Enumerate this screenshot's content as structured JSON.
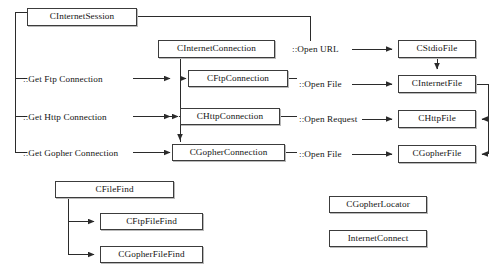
{
  "diagram": {
    "type": "class-relationship-diagram",
    "colors": {
      "background": "#ffffff",
      "box_border": "#3c3c3c",
      "box_fill": "#ffffff",
      "box_shadow": "#b9b9b9",
      "line": "#2b2b2b",
      "text": "#141414"
    },
    "nodes": [
      {
        "id": "cinternetsession",
        "label": "CInternetSession",
        "x": 27,
        "y": 8,
        "w": 110,
        "h": 18
      },
      {
        "id": "cinternetconnection",
        "label": "CInternetConnection",
        "x": 158,
        "y": 40,
        "w": 117,
        "h": 18
      },
      {
        "id": "cftpconnection",
        "label": "CFtpConnection",
        "x": 188,
        "y": 70,
        "w": 100,
        "h": 17
      },
      {
        "id": "chttpconnection",
        "label": "CHttpConnection",
        "x": 180,
        "y": 108,
        "w": 100,
        "h": 17
      },
      {
        "id": "cgopherconnection",
        "label": "CGopherConnection",
        "x": 172,
        "y": 144,
        "w": 113,
        "h": 17
      },
      {
        "id": "cstdiofile",
        "label": "CStdioFile",
        "x": 398,
        "y": 40,
        "w": 78,
        "h": 18
      },
      {
        "id": "cinternetfile",
        "label": "CInternetFile",
        "x": 398,
        "y": 75,
        "w": 78,
        "h": 18
      },
      {
        "id": "chttpfile",
        "label": "CHttpFile",
        "x": 398,
        "y": 110,
        "w": 78,
        "h": 18
      },
      {
        "id": "cgopherfile",
        "label": "CGopherFile",
        "x": 398,
        "y": 145,
        "w": 78,
        "h": 18
      },
      {
        "id": "cfilefind",
        "label": "CFileFind",
        "x": 55,
        "y": 181,
        "w": 119,
        "h": 17
      },
      {
        "id": "cftpfilefind",
        "label": "CFtpFileFind",
        "x": 100,
        "y": 213,
        "w": 103,
        "h": 17
      },
      {
        "id": "cgopherfilefind",
        "label": "CGopherFileFind",
        "x": 100,
        "y": 246,
        "w": 103,
        "h": 17
      },
      {
        "id": "cgopherlocator",
        "label": "CGopherLocator",
        "x": 329,
        "y": 196,
        "w": 98,
        "h": 17
      },
      {
        "id": "internetconnect",
        "label": "InternetConnect",
        "x": 329,
        "y": 230,
        "w": 98,
        "h": 17
      }
    ],
    "labels": [
      {
        "id": "get-ftp-connection",
        "text": "::Get Ftp Connection",
        "x": 23,
        "y": 75
      },
      {
        "id": "get-http-connection",
        "text": "::Get Http Connection",
        "x": 23,
        "y": 113
      },
      {
        "id": "get-gopher-connection",
        "text": "::Get Gopher Connection",
        "x": 23,
        "y": 149
      },
      {
        "id": "open-url",
        "text": "::Open URL",
        "x": 292,
        "y": 46
      },
      {
        "id": "open-file-ftp",
        "text": "::Open File",
        "x": 298,
        "y": 76
      },
      {
        "id": "open-request",
        "text": "::Open Request",
        "x": 298,
        "y": 113
      },
      {
        "id": "open-file-gopher",
        "text": "::Open File",
        "x": 298,
        "y": 149
      }
    ],
    "connections": [
      {
        "from": "CInternetSession",
        "to": "::Get Ftp Connection",
        "kind": "bracket"
      },
      {
        "from": "CInternetSession",
        "to": "::Get Http Connection",
        "kind": "bracket"
      },
      {
        "from": "CInternetSession",
        "to": "::Get Gopher Connection",
        "kind": "bracket"
      },
      {
        "from": "CInternetSession",
        "to": "::Open URL",
        "kind": "elbow"
      },
      {
        "from": "::Get Ftp Connection",
        "to": "CFtpConnection",
        "kind": "arrow"
      },
      {
        "from": "::Get Http Connection",
        "to": "CHttpConnection",
        "kind": "arrow"
      },
      {
        "from": "::Get Gopher Connection",
        "to": "CGopherConnection",
        "kind": "arrow"
      },
      {
        "from": "CInternetConnection",
        "to": "CFtpConnection",
        "kind": "arrow"
      },
      {
        "from": "CInternetConnection",
        "to": "CHttpConnection",
        "kind": "arrow"
      },
      {
        "from": "CInternetConnection",
        "to": "CGopherConnection",
        "kind": "arrow"
      },
      {
        "from": "::Open URL",
        "to": "CStdioFile",
        "kind": "arrow"
      },
      {
        "from": "::Open File",
        "to": "CInternetFile",
        "kind": "arrow"
      },
      {
        "from": "::Open Request",
        "to": "CHttpFile",
        "kind": "arrow"
      },
      {
        "from": "::Open File",
        "to": "CGopherFile",
        "kind": "arrow"
      },
      {
        "from": "CStdioFile",
        "to": "CInternetFile",
        "kind": "arrow-down"
      },
      {
        "from": "CInternetFile",
        "to": "CHttpFile",
        "kind": "elbow-arrow"
      },
      {
        "from": "CInternetFile",
        "to": "CGopherFile",
        "kind": "elbow-arrow"
      },
      {
        "from": "CFileFind",
        "to": "CFtpFileFind",
        "kind": "elbow-arrow"
      },
      {
        "from": "CFileFind",
        "to": "CGopherFileFind",
        "kind": "elbow-arrow"
      }
    ]
  }
}
